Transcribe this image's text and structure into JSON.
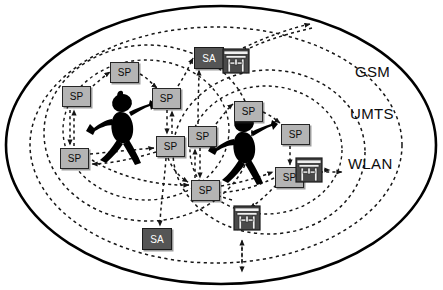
{
  "diagram": {
    "colors": {
      "sp_fill": "#b4b4b4",
      "sa_fill": "#555555",
      "outline": "#000000",
      "dashed": "#1a1a1a",
      "figure": "#000000",
      "torii_dark": "#4a4a4a",
      "torii_light": "#e8e8e8"
    },
    "network_labels": [
      {
        "name": "gsm-label",
        "text": "GSM",
        "x": 355,
        "y": 72
      },
      {
        "name": "umts-label",
        "text": "UMTS",
        "x": 352,
        "y": 114
      },
      {
        "name": "wlan-label",
        "text": "WLAN",
        "x": 350,
        "y": 163
      }
    ],
    "boundaries": {
      "outer_solid_ellipse": {
        "label": "GSM",
        "cx": 221,
        "cy": 145,
        "rx": 216,
        "ry": 140
      },
      "umts_dashed_ellipse": {
        "label": "UMTS",
        "cx": 216,
        "cy": 145,
        "rx": 186,
        "ry": 118
      },
      "wlan_cell_left": {
        "label": "WLAN",
        "cx": 148,
        "cy": 133,
        "rx": 104,
        "ry": 88
      },
      "wlan_cell_right": {
        "label": "WLAN",
        "cx": 269,
        "cy": 152,
        "rx": 96,
        "ry": 82
      }
    },
    "nodes": [
      {
        "id": "sp1",
        "type": "SP",
        "label": "SP",
        "x": 62,
        "y": 86
      },
      {
        "id": "sp2",
        "type": "SP",
        "label": "SP",
        "x": 110,
        "y": 62
      },
      {
        "id": "sp3",
        "type": "SP",
        "label": "SP",
        "x": 152,
        "y": 88
      },
      {
        "id": "sp4",
        "type": "SP",
        "label": "SP",
        "x": 156,
        "y": 136
      },
      {
        "id": "sp5",
        "type": "SP",
        "label": "SP",
        "x": 60,
        "y": 148
      },
      {
        "id": "sp6",
        "type": "SP",
        "label": "SP",
        "x": 188,
        "y": 126
      },
      {
        "id": "sp7",
        "type": "SP",
        "label": "SP",
        "x": 234,
        "y": 101
      },
      {
        "id": "sp8",
        "type": "SP",
        "label": "SP",
        "x": 281,
        "y": 124
      },
      {
        "id": "sp9",
        "type": "SP",
        "label": "SP",
        "x": 275,
        "y": 167
      },
      {
        "id": "sp10",
        "type": "SP",
        "label": "SP",
        "x": 191,
        "y": 180
      },
      {
        "id": "sa1",
        "type": "SA",
        "label": "SA",
        "x": 194,
        "y": 47
      },
      {
        "id": "sa2",
        "type": "SA",
        "label": "SA",
        "x": 142,
        "y": 228
      }
    ],
    "gateways": [
      {
        "id": "gw1",
        "name": "torii-gate-icon",
        "x": 222,
        "y": 46
      },
      {
        "id": "gw2",
        "name": "torii-gate-icon",
        "x": 295,
        "y": 155
      },
      {
        "id": "gw3",
        "name": "torii-gate-icon",
        "x": 233,
        "y": 203
      }
    ],
    "users": [
      {
        "id": "user1",
        "name": "stick-figure-user",
        "x": 96,
        "y": 92
      },
      {
        "id": "user2",
        "name": "stick-figure-user",
        "x": 218,
        "y": 112
      }
    ],
    "external_arrows": [
      {
        "id": "arrow-gsm-out",
        "direction": "up-right",
        "target": "GSM"
      },
      {
        "id": "arrow-wlan-out",
        "direction": "right",
        "target": "WLAN"
      },
      {
        "id": "arrow-down-out",
        "direction": "down",
        "target": ""
      }
    ]
  }
}
